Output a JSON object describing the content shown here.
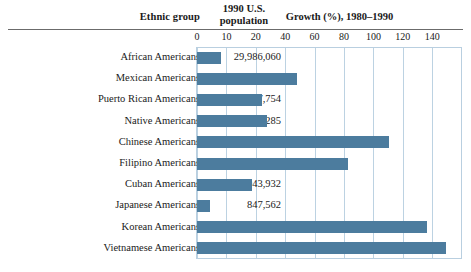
{
  "figure": {
    "headers": {
      "ethnic_group": "Ethnic group",
      "population_line1": "1990 U.S.",
      "population_line2": "population",
      "growth": "Growth (%), 1980–1990"
    },
    "bar_color": "#4c7c9e",
    "gridline_color": "#bcd2e2",
    "rule_color": "#6b6b6b"
  },
  "chart_data": {
    "type": "bar",
    "title": "Growth (%), 1980–1990",
    "orientation": "horizontal",
    "xlabel": "Growth (%), 1980–1990",
    "ylabel": "Ethnic group",
    "grid": true,
    "legend": "none",
    "xlim": [
      0,
      140
    ],
    "tick_labels": [
      "0",
      "10",
      "20",
      "40",
      "60",
      "80",
      "100",
      "120",
      "140"
    ],
    "categories": [
      "African Americans",
      "Mexican Americans",
      "Puerto Rican Americans",
      "Native Americans",
      "Chinese Americans",
      "Filipino Americans",
      "Cuban Americans",
      "Japanese Americans",
      "Korean Americans",
      "Vietnamese Americans"
    ],
    "values": [
      13,
      54,
      35,
      38,
      104,
      82,
      30,
      7,
      125,
      135
    ],
    "populations": [
      "29,986,060",
      "13,495,938",
      "2,727,754",
      "1,878,285",
      "1,645,472",
      "1,406,770",
      "1,043,932",
      "847,562",
      "798,849",
      "614,547"
    ]
  }
}
